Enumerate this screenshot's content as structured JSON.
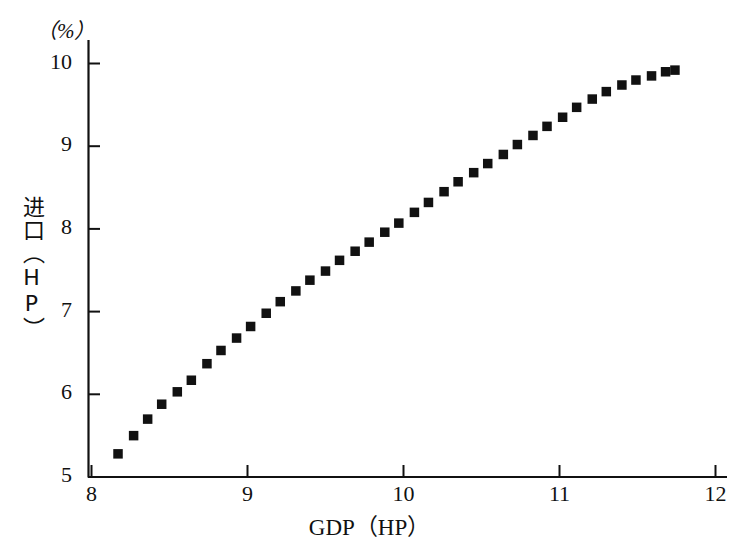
{
  "chart_data": {
    "type": "scatter",
    "title": "",
    "subtitle": "",
    "xlabel": "GDP（HP）",
    "ylabel": "进口（HP）",
    "unit_label": "（%）",
    "xlim": [
      8,
      12
    ],
    "ylim": [
      5,
      10
    ],
    "xticks": [
      8,
      9,
      10,
      11,
      12
    ],
    "xtick_labels": [
      "8",
      "9",
      "10",
      "11",
      "12"
    ],
    "yticks": [
      5,
      6,
      7,
      8,
      9,
      10
    ],
    "ytick_labels": [
      "5",
      "6",
      "7",
      "8",
      "9",
      "10"
    ],
    "grid": false,
    "legend": null,
    "marker": "filled-square",
    "marker_color": "#111111",
    "series": [
      {
        "name": "进口（HP）",
        "x": [
          8.17,
          8.27,
          8.36,
          8.45,
          8.55,
          8.64,
          8.74,
          8.83,
          8.93,
          9.02,
          9.12,
          9.21,
          9.31,
          9.4,
          9.5,
          9.59,
          9.69,
          9.78,
          9.88,
          9.97,
          10.07,
          10.16,
          10.26,
          10.35,
          10.45,
          10.54,
          10.64,
          10.73,
          10.83,
          10.92,
          11.02,
          11.11,
          11.21,
          11.3,
          11.4,
          11.49,
          11.59,
          11.68,
          11.74
        ],
        "y": [
          5.28,
          5.5,
          5.7,
          5.88,
          6.03,
          6.17,
          6.37,
          6.53,
          6.68,
          6.82,
          6.98,
          7.12,
          7.25,
          7.38,
          7.49,
          7.62,
          7.73,
          7.84,
          7.96,
          8.07,
          8.2,
          8.32,
          8.45,
          8.57,
          8.68,
          8.79,
          8.9,
          9.02,
          9.13,
          9.24,
          9.35,
          9.47,
          9.57,
          9.66,
          9.74,
          9.8,
          9.85,
          9.9,
          9.92
        ]
      }
    ]
  },
  "axes": {
    "unit_label": "（%）",
    "xlabel": "GDP（HP）",
    "ylabel": "进口（HP）"
  }
}
